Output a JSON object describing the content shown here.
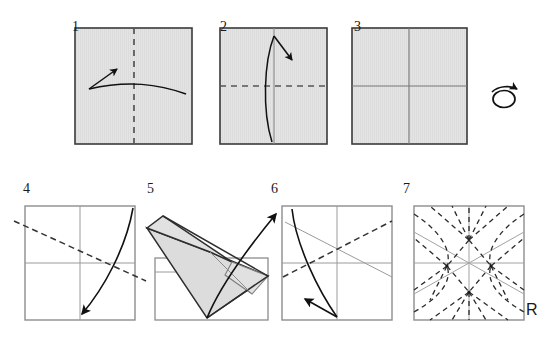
{
  "diagram": {
    "paper_fill": "#e3e3e3",
    "paper_stroke": "#3a3a3a",
    "crease_color": "#8a8a8a",
    "dash_color": "#2b2b2b",
    "arrow_color": "#111111",
    "background": "#ffffff"
  },
  "steps": [
    {
      "number": "1",
      "num_x": 74,
      "num_y": 24,
      "square": {
        "x": 75,
        "y": 28,
        "w": 117,
        "h": 116
      },
      "shaded": true,
      "creases": [],
      "dashed": [
        {
          "x1": 134,
          "y1": 28,
          "x2": 134,
          "y2": 144
        }
      ],
      "arrow": "curve-left-up",
      "caption": "Fold in half vertically"
    },
    {
      "number": "2",
      "num_x": 222,
      "num_y": 24,
      "square": {
        "x": 220,
        "y": 28,
        "w": 107,
        "h": 116
      },
      "shaded": true,
      "creases": [
        {
          "x1": 274,
          "y1": 28,
          "x2": 274,
          "y2": 144
        }
      ],
      "dashed": [
        {
          "x1": 220,
          "y1": 86,
          "x2": 327,
          "y2": 86
        }
      ],
      "arrow": "curve-up-right",
      "caption": "Fold in half horizontally"
    },
    {
      "number": "3",
      "num_x": 355,
      "num_y": 24,
      "square": {
        "x": 352,
        "y": 28,
        "w": 115,
        "h": 116
      },
      "shaded": true,
      "creases": [
        {
          "x1": 409,
          "y1": 28,
          "x2": 409,
          "y2": 144
        },
        {
          "x1": 352,
          "y1": 86,
          "x2": 467,
          "y2": 86
        }
      ],
      "dashed": [],
      "arrow": "turn-over",
      "caption": "Turn the paper over"
    },
    {
      "number": "4",
      "num_x": 24,
      "num_y": 186,
      "square": {
        "x": 25,
        "y": 206,
        "w": 110,
        "h": 114
      },
      "shaded": false,
      "creases": [
        {
          "x1": 80,
          "y1": 206,
          "x2": 80,
          "y2": 320
        },
        {
          "x1": 25,
          "y1": 263,
          "x2": 135,
          "y2": 263
        }
      ],
      "dashed": [
        {
          "x1": 14,
          "y1": 222,
          "x2": 146,
          "y2": 280
        }
      ],
      "arrow": "curve-down-left",
      "caption": "Diagonal valley fold"
    },
    {
      "number": "5",
      "num_x": 148,
      "num_y": 186,
      "square": {
        "x": 155,
        "y": 258,
        "w": 113,
        "h": 62
      },
      "shaded": false,
      "creases": [],
      "dashed": [],
      "arrow": "unfold-up-right",
      "caption": "Flap folded over, unfold"
    },
    {
      "number": "6",
      "num_x": 272,
      "num_y": 186,
      "square": {
        "x": 282,
        "y": 206,
        "w": 110,
        "h": 114
      },
      "shaded": false,
      "creases": [
        {
          "x1": 337,
          "y1": 206,
          "x2": 337,
          "y2": 320
        },
        {
          "x1": 282,
          "y1": 263,
          "x2": 392,
          "y2": 263
        },
        {
          "x1": 286,
          "y1": 222,
          "x2": 392,
          "y2": 276
        }
      ],
      "dashed": [
        {
          "x1": 282,
          "y1": 276,
          "x2": 392,
          "y2": 222
        }
      ],
      "arrow": "curve-down-left-2",
      "caption": "Mirror diagonal fold"
    },
    {
      "number": "7",
      "num_x": 404,
      "num_y": 186,
      "square": {
        "x": 414,
        "y": 206,
        "w": 110,
        "h": 114
      },
      "shaded": false,
      "creases": [
        {
          "x1": 469,
          "y1": 206,
          "x2": 469,
          "y2": 320
        },
        {
          "x1": 414,
          "y1": 263,
          "x2": 524,
          "y2": 263
        },
        {
          "x1": 414,
          "y1": 232,
          "x2": 524,
          "y2": 294
        },
        {
          "x1": 414,
          "y1": 294,
          "x2": 524,
          "y2": 232
        }
      ],
      "dashed": [],
      "arrow": "none",
      "caption": "Completed crease pattern"
    }
  ],
  "labels": {
    "reference": "R",
    "reference_x": 525,
    "reference_y": 303
  },
  "crease_pattern": {
    "nodes": [
      {
        "x": 469,
        "y": 240
      },
      {
        "x": 447,
        "y": 266
      },
      {
        "x": 491,
        "y": 266
      },
      {
        "x": 469,
        "y": 292
      }
    ],
    "dashed_rays": 24,
    "description": "Radial mountain-fold rays from four interior nodes"
  }
}
